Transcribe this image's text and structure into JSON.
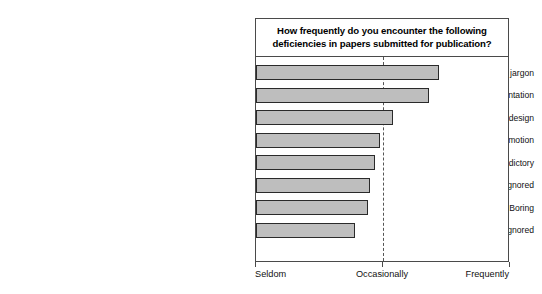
{
  "chart_data": {
    "type": "bar",
    "orientation": "horizontal",
    "title": "How frequently do you encounter the following deficiencies in papers submitted for publication?",
    "xlabel": "",
    "ylabel": "",
    "categories": [
      "Poorly written; excessive jargon",
      "Inadequate or inappropriate presentation",
      "Failure to give a detailed explanation of the design",
      "Excessive zeal and self-promotion",
      "Rationale confused, contradictory",
      "Essential data omitted or ignored",
      "Boring",
      "Important work by others ignored"
    ],
    "values": [
      72,
      68,
      54,
      49,
      47,
      45,
      44,
      39
    ],
    "xlim": [
      0,
      100
    ],
    "xticks": [
      0,
      50,
      100
    ],
    "xticklabels": [
      "Seldom",
      "Occasionally",
      "Frequently"
    ],
    "grid": false,
    "legend": false,
    "annotations": [
      {
        "type": "vertical-dashed-line",
        "x": 50,
        "label": "Occasionally"
      }
    ],
    "colors": {
      "bar_fill": "#bebebe",
      "bar_edge": "#2a2a2a",
      "frame": "#4a4a4a",
      "dashed_line": "#555555",
      "text": "#111111",
      "background": "#ffffff"
    }
  }
}
